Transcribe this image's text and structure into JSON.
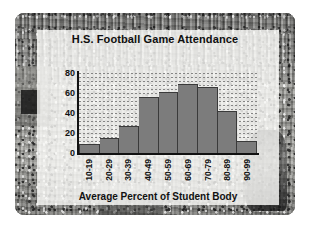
{
  "figure": {
    "background_description": "stadium-crowd-photo",
    "frame_color": "#ffffff",
    "panel_color": "rgba(252,252,250,0.80)"
  },
  "chart_data": {
    "type": "bar",
    "title": "H.S. Football Game Attendance",
    "xlabel": "Average Percent of Student Body",
    "ylabel": "Number of Schools",
    "categories": [
      "10-19",
      "20-29",
      "30-39",
      "40-49",
      "50-59",
      "60-69",
      "70-79",
      "80-89",
      "90-99"
    ],
    "values": [
      9,
      15,
      28,
      57,
      63,
      71,
      68,
      43,
      12
    ],
    "ylim": [
      0,
      84
    ],
    "yticks": [
      0,
      20,
      40,
      60,
      80
    ],
    "ytick_labels": [
      "0",
      "20",
      "40",
      "60",
      "80"
    ],
    "grid": true,
    "grid_style": "dotted-horizontal",
    "legend": "none",
    "bar_color": "#7c7c7c",
    "bar_edge_color": "#3a3a3a",
    "axis_color": "#111111"
  }
}
